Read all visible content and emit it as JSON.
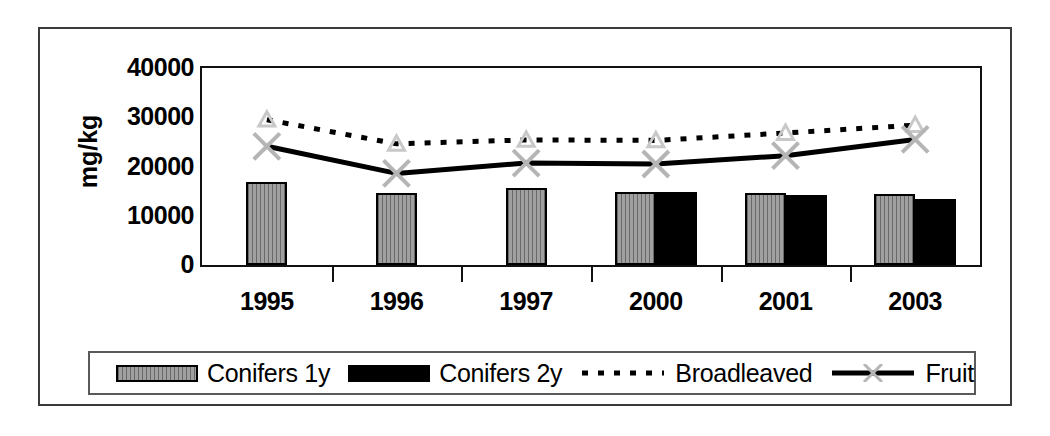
{
  "chart_data": {
    "type": "bar",
    "title": "",
    "xlabel": "",
    "ylabel": "mg/kg",
    "categories": [
      "1995",
      "1996",
      "1997",
      "2000",
      "2001",
      "2003"
    ],
    "ylim": [
      0,
      40000
    ],
    "y_ticks": [
      0,
      10000,
      20000,
      30000,
      40000
    ],
    "y_tick_labels": [
      "0",
      "10000",
      "20000",
      "30000",
      "40000"
    ],
    "grid": false,
    "legend_position": "bottom",
    "series": [
      {
        "name": "Conifers 1y",
        "kind": "bar",
        "style": "grey-hatched",
        "color": "#a0a0a0",
        "values": [
          16800,
          14600,
          15600,
          14800,
          14700,
          14400
        ]
      },
      {
        "name": "Conifers 2y",
        "kind": "bar",
        "style": "solid-black",
        "color": "#000000",
        "values": [
          null,
          null,
          null,
          14900,
          14200,
          13500
        ]
      },
      {
        "name": "Broadleaved",
        "kind": "line",
        "style": "dotted",
        "marker": "triangle",
        "color": "#000000",
        "values": [
          29500,
          24600,
          25400,
          25300,
          26800,
          28400
        ]
      },
      {
        "name": "Fruit",
        "kind": "line",
        "style": "solid",
        "marker": "x",
        "color": "#000000",
        "marker_color": "#b5b5b5",
        "values": [
          24100,
          18600,
          20700,
          20500,
          22200,
          25500
        ]
      }
    ]
  },
  "axis": {
    "y_title": "mg/kg"
  },
  "legend": {
    "entries": [
      {
        "label": "Conifers 1y",
        "swatch": "grey-hatched-bar-icon"
      },
      {
        "label": "Conifers 2y",
        "swatch": "black-bar-icon"
      },
      {
        "label": "Broadleaved",
        "swatch": "dotted-line-icon"
      },
      {
        "label": "Fruit",
        "swatch": "solid-line-x-marker-icon"
      }
    ]
  }
}
